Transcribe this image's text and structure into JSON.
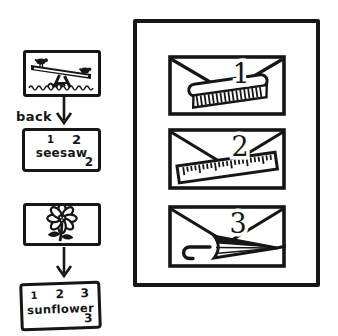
{
  "palette": {
    "ink": "#161616",
    "paper": "#ffffff"
  },
  "left_column": {
    "front_card_1": {
      "icon": "seesaw-drawing"
    },
    "arrow_1": {
      "icon": "down-arrow"
    },
    "back_label": "back",
    "back_card_1": {
      "top_numbers": [
        "1",
        "2"
      ],
      "word": "seesaw",
      "corner_number": "2"
    },
    "front_card_2": {
      "icon": "sunflower-drawing"
    },
    "arrow_2": {
      "icon": "down-arrow"
    },
    "back_card_2": {
      "top_numbers": [
        "1",
        "2",
        "3"
      ],
      "word": "sunflower",
      "corner_number": "3"
    }
  },
  "box": {
    "envelopes": [
      {
        "number": "1",
        "icon": "comb-icon"
      },
      {
        "number": "2",
        "icon": "ruler-icon"
      },
      {
        "number": "3",
        "icon": "umbrella-icon"
      }
    ]
  }
}
